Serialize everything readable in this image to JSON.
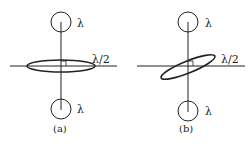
{
  "panels": [
    {
      "caption": "(a)",
      "top_label": "λ",
      "bottom_label": "λ",
      "ellipse_label": "λ/2",
      "ellipse_orientation": "horizontal"
    },
    {
      "caption": "(b)",
      "top_label": "λ",
      "bottom_label": "λ",
      "ellipse_label": "λ/2",
      "ellipse_orientation": "tilted"
    }
  ],
  "colors": {
    "stroke": "#222222",
    "background": "#ffffff"
  }
}
